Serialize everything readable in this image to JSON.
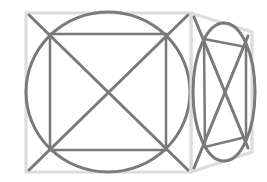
{
  "diagram": {
    "colors": {
      "background": "#ffffff",
      "face_outline": "#dcdcdc",
      "figure_stroke": "#7a7a7a"
    },
    "front_face": {
      "outline": {
        "x": 26,
        "y": 13,
        "w": 165,
        "h": 159
      },
      "circle": {
        "cx": 108,
        "cy": 92,
        "rx": 82,
        "ry": 80
      },
      "inner_square": {
        "x": 50,
        "y": 34,
        "w": 116,
        "h": 116
      },
      "diagonals": [
        {
          "x1": 29,
          "y1": 15,
          "x2": 188,
          "y2": 170
        },
        {
          "x1": 29,
          "y1": 170,
          "x2": 188,
          "y2": 15
        }
      ]
    },
    "side_face": {
      "outline": [
        [
          191,
          13
        ],
        [
          252,
          32
        ],
        [
          252,
          152
        ],
        [
          191,
          172
        ]
      ],
      "ellipse": {
        "cx": 224,
        "cy": 92,
        "rx": 31,
        "ry": 69
      },
      "inner_quad": [
        [
          204,
          39
        ],
        [
          246,
          47
        ],
        [
          246,
          137
        ],
        [
          205,
          147
        ]
      ],
      "diagonals": [
        {
          "x1": 194,
          "y1": 17,
          "x2": 248,
          "y2": 148
        },
        {
          "x1": 194,
          "y1": 168,
          "x2": 248,
          "y2": 36
        }
      ]
    }
  }
}
